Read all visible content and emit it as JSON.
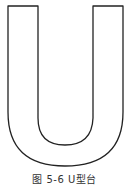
{
  "figure": {
    "caption": "图 5-6  U型台",
    "shape": "u-shaped-table",
    "stroke_color": "#222222",
    "fill_color": "#ffffff"
  }
}
